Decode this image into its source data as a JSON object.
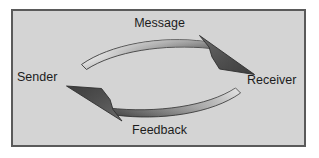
{
  "diagram": {
    "frame": {
      "background_color": "#d4d4d4",
      "border_color": "#5a5a5a",
      "outer_background": "#ffffff"
    },
    "labels": {
      "message": "Message",
      "sender": "Sender",
      "receiver": "Receiver",
      "feedback": "Feedback"
    },
    "arrows": [
      {
        "name": "message-arrow",
        "from": "Sender",
        "to": "Receiver",
        "direction": "left-to-right",
        "curve": "arc-upward",
        "tail_color": "#f2f2f2",
        "head_color": "#4a4a4a",
        "outline_color": "#3a3a3a"
      },
      {
        "name": "feedback-arrow",
        "from": "Receiver",
        "to": "Sender",
        "direction": "right-to-left",
        "curve": "arc-downward",
        "tail_color": "#c9c9c9",
        "head_color": "#4a4a4a",
        "outline_color": "#3a3a3a"
      }
    ]
  }
}
